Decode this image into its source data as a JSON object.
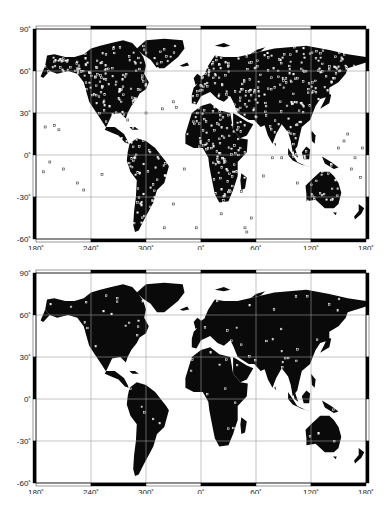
{
  "figure": {
    "panels": [
      {
        "id": "top",
        "description": "World map with dense station markers (hollow squares)",
        "station_density": "high",
        "ocean_stations": true
      },
      {
        "id": "bottom",
        "description": "World map with sparse station markers",
        "station_density": "low",
        "ocean_stations": false
      }
    ],
    "x_axis": {
      "ticks": [
        "180˚",
        "240˚",
        "300˚",
        "0˚",
        "60˚",
        "120˚",
        "180˚"
      ],
      "lon_values": [
        180,
        240,
        300,
        360,
        420,
        480,
        540
      ]
    },
    "y_axis": {
      "ticks": [
        "90˚",
        "60˚",
        "30˚",
        "0˚",
        "-30˚",
        "-60˚"
      ],
      "lat_values": [
        90,
        60,
        30,
        0,
        -30,
        -60
      ]
    },
    "colors": {
      "land": "#0a0a0a",
      "ocean": "#ffffff",
      "grid": "#9a9a9a",
      "station": "#ffffff",
      "frame": "#000000"
    }
  }
}
